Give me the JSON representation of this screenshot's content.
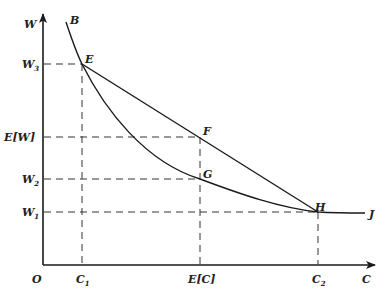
{
  "diagram": {
    "axes": {
      "y_label": "W",
      "x_label": "C",
      "origin_label": "O"
    },
    "y_ticks": [
      {
        "base": "W",
        "sub": "3",
        "y": 64
      },
      {
        "base": "E[W]",
        "sub": "",
        "y": 137
      },
      {
        "base": "W",
        "sub": "2",
        "y": 179
      },
      {
        "base": "W",
        "sub": "1",
        "y": 212
      }
    ],
    "x_ticks": [
      {
        "base": "C",
        "sub": "1",
        "x": 82
      },
      {
        "base": "E[C]",
        "sub": "",
        "x": 200
      },
      {
        "base": "C",
        "sub": "2",
        "x": 318
      }
    ],
    "points": {
      "B": "B",
      "E": "E",
      "F": "F",
      "G": "G",
      "H": "H",
      "J": "J"
    },
    "colors": {
      "line": "#1a1a1a",
      "background": "#ffffff"
    }
  }
}
